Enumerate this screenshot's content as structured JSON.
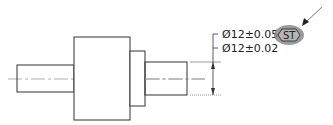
{
  "drawing": {
    "annotations": {
      "line1": "Ø12±0.05",
      "line2": "Ø12±0.02",
      "symbol": "ST"
    },
    "colors": {
      "outline": "#333333",
      "centerline": "#888888",
      "highlight": "#8a8a8a",
      "text": "#222222"
    }
  }
}
